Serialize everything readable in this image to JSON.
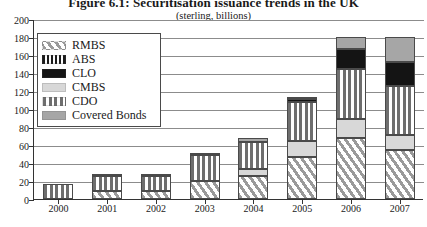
{
  "header": {
    "title": "Figure 6.1: Securitisation issuance trends in the UK",
    "subtitle": "(sterling, billions)"
  },
  "legend": {
    "position": "inside-top-left",
    "items": [
      {
        "label": "RMBS",
        "swatch": "diagonal-hatch-light-gray",
        "color": "#9a9a9a"
      },
      {
        "label": "ABS",
        "swatch": "vertical-dash-black",
        "color": "#1c1c1c"
      },
      {
        "label": "CLO",
        "swatch": "solid-black",
        "color": "#141414"
      },
      {
        "label": "CMBS",
        "swatch": "solid-light-gray",
        "color": "#d8d8d8"
      },
      {
        "label": "CDO",
        "swatch": "solid-mid-dark-gray",
        "color": "#565656"
      },
      {
        "label": "Covered Bonds",
        "swatch": "solid-mid-gray",
        "color": "#a6a6a6"
      }
    ]
  },
  "axes": {
    "y_ticks": [
      "0",
      "20",
      "40",
      "60",
      "80",
      "100",
      "120",
      "140",
      "160",
      "180",
      "200"
    ],
    "x_ticks": [
      "2000",
      "2001",
      "2002",
      "2003",
      "2004",
      "2005",
      "2006",
      "2007"
    ]
  },
  "chart_data": {
    "type": "bar",
    "stacked": true,
    "title": "Figure 6.1: Securitisation issuance trends in the UK",
    "subtitle": "(sterling, billions)",
    "xlabel": "",
    "ylabel": "",
    "ylim": [
      0,
      200
    ],
    "ytick_step": 20,
    "grid": true,
    "legend_position": "inside-top-left",
    "categories": [
      "2000",
      "2001",
      "2002",
      "2003",
      "2004",
      "2005",
      "2006",
      "2007"
    ],
    "series": [
      {
        "name": "RMBS",
        "color": "#9a9a9a",
        "pattern": "diagonal-hatch",
        "values": [
          0,
          9,
          9,
          20,
          26,
          47,
          68,
          54
        ]
      },
      {
        "name": "CMBS",
        "color": "#d8d8d8",
        "pattern": "solid",
        "values": [
          0,
          0,
          0,
          0,
          7,
          18,
          21,
          17
        ]
      },
      {
        "name": "CDO",
        "color": "#565656",
        "pattern": "vertical-stripe",
        "values": [
          17,
          17,
          17,
          29,
          30,
          43,
          56,
          55
        ]
      },
      {
        "name": "CLO",
        "color": "#141414",
        "pattern": "solid",
        "values": [
          0,
          0,
          0,
          0,
          0,
          3,
          22,
          26
        ]
      },
      {
        "name": "ABS",
        "color": "#1c1c1c",
        "pattern": "vertical-dash",
        "values": [
          0,
          2,
          2,
          2,
          0,
          0,
          0,
          0
        ]
      },
      {
        "name": "Covered Bonds",
        "color": "#a6a6a6",
        "pattern": "solid",
        "values": [
          0,
          0,
          0,
          0,
          5,
          2,
          13,
          28
        ]
      }
    ],
    "totals": [
      17,
      28,
      28,
      51,
      68,
      113,
      180,
      180
    ]
  }
}
